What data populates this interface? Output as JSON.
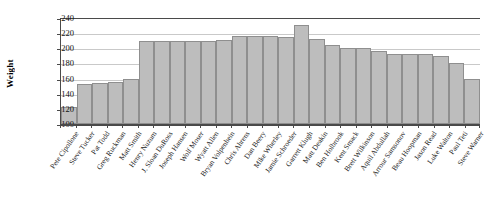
{
  "chart": {
    "type": "bar",
    "ylabel": "Weight"
  },
  "chart_data": {
    "type": "bar",
    "title": "",
    "xlabel": "",
    "ylabel": "Weight",
    "ylim": [
      100,
      240
    ],
    "yticks": [
      100,
      120,
      140,
      160,
      180,
      200,
      220,
      240
    ],
    "grid": true,
    "legend": null,
    "categories": [
      "Pete Cipollone",
      "Steve Tucker",
      "Pat Todd",
      "Greg Ruckman",
      "Matt Smith",
      "Henry Nuzum",
      "J. Sloan DuRoss",
      "Joseph Hansen",
      "Wolf Moser",
      "Wyatt Allen",
      "Bryan Volpenhein",
      "Chris Ahrens",
      "Dan Beery",
      "Mike Wherley",
      "Jamie Schroeder",
      "Garrett Klugh",
      "Matt Deakin",
      "Ben Holbrook",
      "Kent Smack",
      "Brett Wilkinson",
      "Aquil Abdullah",
      "Arrour Samsonov",
      "Beau Hoopman",
      "Jason Read",
      "Luke Walton",
      "Paul Teti",
      "Steve Warner"
    ],
    "values": [
      122,
      153,
      154,
      155,
      160,
      210,
      210,
      210,
      210,
      210,
      211,
      216,
      216,
      216,
      215,
      231,
      212,
      205,
      200,
      200,
      197,
      193,
      193,
      193,
      190,
      180,
      160
    ]
  }
}
